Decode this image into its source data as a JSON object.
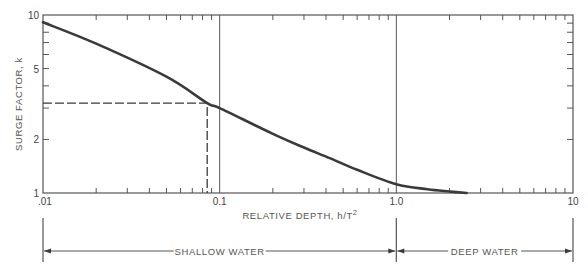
{
  "chart_data": {
    "type": "line",
    "title": "",
    "xlabel": "RELATIVE DEPTH, h/T",
    "xlabel_superscript": "2",
    "ylabel": "SURGE FACTOR, k",
    "xscale": "log",
    "yscale": "log",
    "xlim": [
      0.01,
      10
    ],
    "ylim": [
      1,
      10
    ],
    "x_tick_labels": [
      ".01",
      "0.1",
      "1.0",
      "10"
    ],
    "x_tick_values": [
      0.01,
      0.1,
      1.0,
      10
    ],
    "y_tick_labels": [
      "1",
      "2",
      "5",
      "10"
    ],
    "y_tick_values": [
      1,
      2,
      5,
      10
    ],
    "grid": false,
    "vertical_reference_lines": [
      0.1,
      1.0
    ],
    "series": [
      {
        "name": "surge factor curve",
        "x": [
          0.01,
          0.02,
          0.05,
          0.085,
          0.1,
          0.2,
          0.3,
          0.42,
          0.6,
          1.0,
          1.5,
          2.0,
          2.5
        ],
        "y": [
          9.1,
          6.9,
          4.5,
          3.2,
          3.0,
          2.15,
          1.8,
          1.57,
          1.35,
          1.12,
          1.05,
          1.02,
          1.0
        ]
      }
    ],
    "annotations": [
      {
        "type": "dashed-guide",
        "x": 0.085,
        "y": 3.2,
        "note": "horizontal from y-axis to curve, vertical from curve to x-axis"
      }
    ],
    "regions": [
      {
        "label": "SHALLOW WATER",
        "from": 0.01,
        "to": 1.0
      },
      {
        "label": "DEEP WATER",
        "from": 1.0,
        "to": 10
      }
    ]
  },
  "colors": {
    "curve": "#3a3a3a",
    "frame": "#555555",
    "text": "#444444"
  }
}
